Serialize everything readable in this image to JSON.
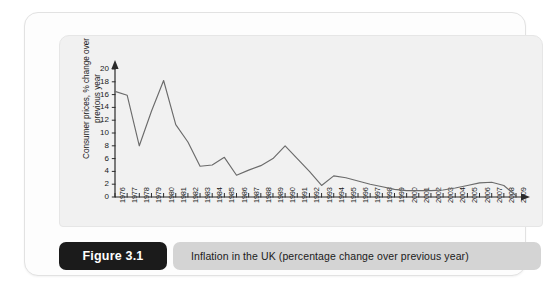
{
  "figure": {
    "badge_label": "Figure 3.1",
    "caption": "Inflation in the UK (percentage change over previous year)",
    "watermark_text": "",
    "accent_badge_color": "#1b1b1b",
    "caption_bar_color": "#d4d4d4",
    "panel_background": "#f1f1f1",
    "line_color": "#6b6b6b"
  },
  "chart_data": {
    "type": "line",
    "title": "",
    "xlabel": "",
    "ylabel": "Consumer prices, % change over previous year",
    "ylim": [
      0,
      20
    ],
    "yticks": [
      0,
      2,
      4,
      6,
      8,
      10,
      12,
      14,
      16,
      18,
      20
    ],
    "grid": false,
    "legend": null,
    "x": [
      1976,
      1977,
      1978,
      1979,
      1980,
      1981,
      1982,
      1983,
      1984,
      1985,
      1986,
      1987,
      1988,
      1989,
      1990,
      1991,
      1992,
      1993,
      1994,
      1995,
      1996,
      1997,
      1998,
      1999,
      2000,
      2001,
      2002,
      2003,
      2004,
      2005,
      2006,
      2007,
      2008,
      2009
    ],
    "categories": [
      "1976",
      "1977",
      "1978",
      "1979",
      "1980",
      "1981",
      "1982",
      "1983",
      "1984",
      "1985",
      "1986",
      "1987",
      "1988",
      "1989",
      "1990",
      "1991",
      "1992",
      "1993",
      "1994",
      "1995",
      "1996",
      "1997",
      "1998",
      "1999",
      "2000",
      "2001",
      "2002",
      "2003",
      "2004",
      "2005",
      "2006",
      "2007",
      "2008",
      "2009"
    ],
    "values": [
      16.5,
      15.9,
      8.0,
      13.4,
      18.2,
      11.3,
      8.6,
      4.8,
      5.0,
      6.2,
      3.4,
      4.2,
      4.9,
      6.0,
      8.0,
      6.0,
      4.0,
      1.8,
      3.3,
      3.0,
      2.5,
      2.0,
      1.6,
      1.2,
      1.0,
      1.0,
      1.0,
      1.1,
      1.4,
      1.8,
      2.2,
      2.3,
      1.8,
      0.2
    ],
    "series": [
      {
        "name": "Consumer prices, % change over previous year",
        "values": [
          16.5,
          15.9,
          8.0,
          13.4,
          18.2,
          11.3,
          8.6,
          4.8,
          5.0,
          6.2,
          3.4,
          4.2,
          4.9,
          6.0,
          8.0,
          6.0,
          4.0,
          1.8,
          3.3,
          3.0,
          2.5,
          2.0,
          1.6,
          1.2,
          1.0,
          1.0,
          1.0,
          1.1,
          1.4,
          1.8,
          2.2,
          2.3,
          1.8,
          0.2
        ]
      }
    ]
  }
}
